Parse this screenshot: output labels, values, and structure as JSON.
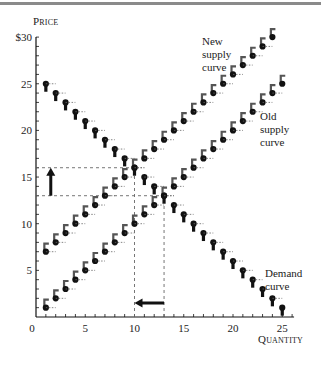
{
  "chart_data": {
    "type": "line",
    "title": "",
    "xlabel": "Quantity",
    "ylabel": "Price",
    "xlim": [
      0,
      26
    ],
    "ylim": [
      0,
      30
    ],
    "x_ticks": [
      "0",
      "5",
      "10",
      "15",
      "20",
      "25"
    ],
    "y_ticks": [
      "5",
      "10",
      "15",
      "20",
      "25",
      "$30"
    ],
    "grid": false,
    "series": [
      {
        "name": "Demand curve",
        "x": [
          1,
          2,
          3,
          4,
          5,
          6,
          7,
          8,
          9,
          10,
          11,
          12,
          13,
          14,
          15,
          16,
          17,
          18,
          19,
          20,
          21,
          22,
          23,
          24,
          25
        ],
        "y": [
          25,
          24,
          23,
          22,
          21,
          20,
          19,
          18,
          17,
          16,
          15,
          14,
          13,
          12,
          11,
          10,
          9,
          8,
          7,
          6,
          5,
          4,
          3,
          2,
          1
        ]
      },
      {
        "name": "Old supply curve",
        "x": [
          1,
          2,
          3,
          4,
          5,
          6,
          7,
          8,
          9,
          10,
          11,
          12,
          13,
          14,
          15,
          16,
          17,
          18,
          19,
          20,
          21,
          22,
          23,
          24,
          25
        ],
        "y": [
          1,
          2,
          3,
          4,
          5,
          6,
          7,
          8,
          9,
          10,
          11,
          12,
          13,
          14,
          15,
          16,
          17,
          18,
          19,
          20,
          21,
          22,
          23,
          24,
          25
        ]
      },
      {
        "name": "New supply curve",
        "x": [
          1,
          2,
          3,
          4,
          5,
          6,
          7,
          8,
          9,
          10,
          11,
          12,
          13,
          14,
          15,
          16,
          17,
          18,
          19,
          20,
          21,
          22,
          23,
          24
        ],
        "y": [
          7,
          8,
          9,
          10,
          11,
          12,
          13,
          14,
          15,
          16,
          17,
          18,
          19,
          20,
          21,
          22,
          23,
          24,
          25,
          26,
          27,
          28,
          29,
          30
        ]
      }
    ],
    "annotations": [
      {
        "type": "dashed-hline",
        "y": 16,
        "x_range": [
          0,
          10
        ]
      },
      {
        "type": "dashed-hline",
        "y": 13,
        "x_range": [
          0,
          13
        ]
      },
      {
        "type": "dashed-vline",
        "x": 10,
        "y_range": [
          0,
          16
        ]
      },
      {
        "type": "dashed-vline",
        "x": 13,
        "y_range": [
          0,
          13
        ]
      },
      {
        "type": "arrow-up",
        "x": 1.5,
        "from": 13,
        "to": 16,
        "meaning": "price rises"
      },
      {
        "type": "arrow-left",
        "y": 1.5,
        "from": 13,
        "to": 10,
        "meaning": "quantity falls"
      }
    ],
    "equilibria": {
      "old": {
        "quantity": 13,
        "price": 13
      },
      "new": {
        "quantity": 10,
        "price": 16
      }
    }
  },
  "labels": {
    "price_axis": "Price",
    "quantity_axis": "Quantity",
    "new_supply": [
      "New",
      "supply",
      "curve"
    ],
    "old_supply": [
      "Old",
      "supply",
      "curve"
    ],
    "demand": [
      "Demand",
      "curve"
    ]
  },
  "ticks": {
    "x": [
      "0",
      "5",
      "10",
      "15",
      "20",
      "25"
    ],
    "y": [
      "5",
      "10",
      "15",
      "20",
      "25",
      "$30"
    ]
  },
  "colors": {
    "ink": "#111111",
    "stem": "#555555",
    "dash": "#666666"
  }
}
